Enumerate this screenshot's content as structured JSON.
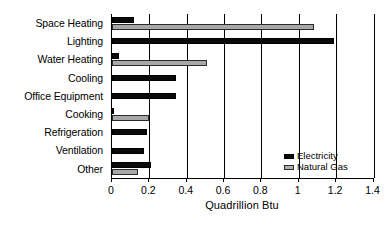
{
  "chart_data": {
    "type": "bar",
    "orientation": "horizontal",
    "title": "",
    "xlabel": "Quadrillion Btu",
    "ylabel": "",
    "xlim": [
      0,
      1.4
    ],
    "xticks": [
      "0",
      "0.2",
      "0.4",
      "0.6",
      "0.8",
      "1",
      "1.2",
      "1.4"
    ],
    "xtick_values": [
      0,
      0.2,
      0.4,
      0.6,
      0.8,
      1,
      1.2,
      1.4
    ],
    "grid": true,
    "grid_axis": "x",
    "legend_position": "lower-right",
    "categories": [
      "Space Heating",
      "Lighting",
      "Water Heating",
      "Cooling",
      "Office Equipment",
      "Cooking",
      "Refrigeration",
      "Ventilation",
      "Other"
    ],
    "series": [
      {
        "name": "Electricity",
        "color": "#0a0a0a",
        "values": [
          0.12,
          1.19,
          0.04,
          0.34,
          0.34,
          0.01,
          0.19,
          0.17,
          0.21
        ]
      },
      {
        "name": "Natural Gas",
        "color": "#a8a8a8",
        "values": [
          1.08,
          0,
          0.51,
          0,
          0,
          0.2,
          0,
          0,
          0.14
        ]
      }
    ]
  },
  "legend": {
    "items": [
      {
        "label": "Electricity",
        "swatch": "electricity-swatch"
      },
      {
        "label": "Natural Gas",
        "swatch": "natural-gas-swatch"
      }
    ]
  }
}
